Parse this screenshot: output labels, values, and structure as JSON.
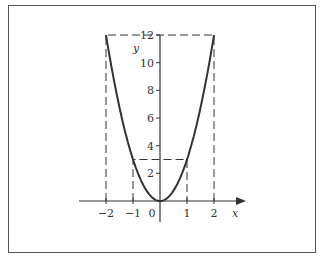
{
  "chart_data": {
    "type": "line",
    "title": "",
    "function": "y = 3x^2",
    "xlabel": "x",
    "ylabel": "y",
    "x_ticks": [
      -2,
      -1,
      0,
      1,
      2
    ],
    "y_ticks": [
      2,
      4,
      6,
      8,
      10,
      12
    ],
    "xlim": [
      -2.3,
      2.7
    ],
    "ylim": [
      -1.5,
      12.5
    ],
    "series": [
      {
        "name": "y = 3x^2",
        "x": [
          -2,
          -1.5,
          -1,
          -0.5,
          0,
          0.5,
          1,
          1.5,
          2
        ],
        "y": [
          12,
          6.75,
          3,
          0.75,
          0,
          0.75,
          3,
          6.75,
          12
        ]
      }
    ],
    "guides": [
      {
        "type": "dashed",
        "points": [
          [
            -2,
            0
          ],
          [
            -2,
            12
          ],
          [
            2,
            12
          ],
          [
            2,
            0
          ]
        ]
      },
      {
        "type": "dashed",
        "points": [
          [
            -1,
            0
          ],
          [
            -1,
            3
          ],
          [
            1,
            3
          ],
          [
            1,
            0
          ]
        ]
      }
    ],
    "grid": false,
    "legend": null
  },
  "labels": {
    "x_axis": "x",
    "y_axis": "y",
    "origin": "0",
    "x_tick_labels": [
      "−2",
      "−1",
      "1",
      "2"
    ],
    "y_tick_labels": [
      "2",
      "4",
      "6",
      "8",
      "10",
      "12"
    ]
  }
}
